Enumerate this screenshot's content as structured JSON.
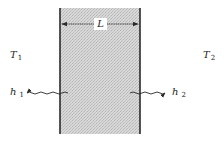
{
  "figure": {
    "colors": {
      "background": "#ffffff",
      "slab_fill": "#d6d6d6",
      "slab_stipple": "#b8b8b8",
      "edge_line": "#2a2a2a",
      "text": "#222222"
    },
    "slab": {
      "x": 60,
      "y": 8,
      "width": 80,
      "height": 126
    },
    "dimension": {
      "label": "L",
      "y": 24
    },
    "left_side": {
      "temperature_symbol": "T",
      "temperature_subscript": "1",
      "coefficient_symbol": "h",
      "coefficient_subscript": "1",
      "arrow_direction": "left"
    },
    "right_side": {
      "temperature_symbol": "T",
      "temperature_subscript": "2",
      "coefficient_symbol": "h",
      "coefficient_subscript": "2",
      "arrow_direction": "right"
    }
  }
}
